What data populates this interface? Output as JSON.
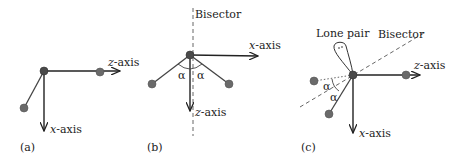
{
  "panels": [
    {
      "id": "a",
      "label": "(a)",
      "axes": [
        {
          "name": "z",
          "label_var": "z",
          "label_suffix": "-axis",
          "direction": "right"
        },
        {
          "name": "x",
          "label_var": "x",
          "label_suffix": "-axis",
          "direction": "down"
        }
      ]
    },
    {
      "id": "b",
      "label": "(b)",
      "bisector_label": "Bisector",
      "angle_symbol": "α",
      "axes": [
        {
          "name": "x",
          "label_var": "x",
          "label_suffix": "-axis",
          "direction": "right"
        },
        {
          "name": "z",
          "label_var": "z",
          "label_suffix": "-axis",
          "direction": "down"
        }
      ]
    },
    {
      "id": "c",
      "label": "(c)",
      "bisector_label": "Bisector",
      "lone_pair_label": "Lone pair",
      "angle_symbol": "α",
      "axes": [
        {
          "name": "z",
          "label_var": "z",
          "label_suffix": "-axis",
          "direction": "right"
        },
        {
          "name": "x",
          "label_var": "x",
          "label_suffix": "-axis",
          "direction": "down"
        }
      ]
    }
  ],
  "colors": {
    "line": "#222222",
    "atom": "#6a6a6a",
    "dashed": "#666666"
  }
}
